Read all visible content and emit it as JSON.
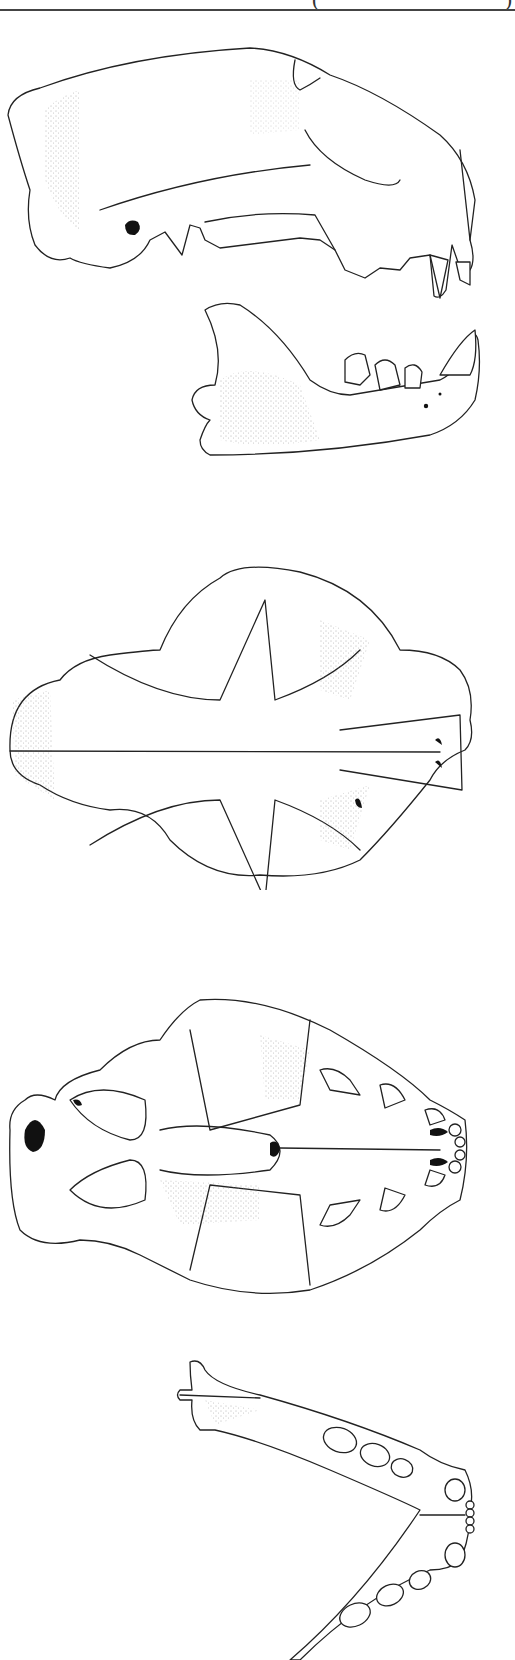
{
  "figure": {
    "header_fragment": {
      "open_paren": "(",
      "close_paren": ")"
    },
    "style": "black ink line drawing with stipple shading",
    "colors": {
      "ink": "#222222",
      "background": "#ffffff",
      "rule": "#444444"
    },
    "views": [
      {
        "id": "lateral-cranium",
        "label": "cranium, lateral view",
        "y_range": [
          40,
          300
        ]
      },
      {
        "id": "lateral-mandible",
        "label": "mandible, lateral view",
        "y_range": [
          290,
          460
        ]
      },
      {
        "id": "dorsal-cranium",
        "label": "cranium, dorsal view",
        "y_range": [
          540,
          880
        ]
      },
      {
        "id": "ventral-cranium",
        "label": "cranium, ventral view",
        "y_range": [
          950,
          1300
        ]
      },
      {
        "id": "occlusal-mandible",
        "label": "mandible, occlusal view",
        "y_range": [
          1350,
          1660
        ]
      }
    ]
  }
}
